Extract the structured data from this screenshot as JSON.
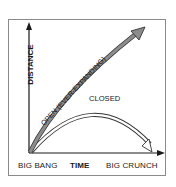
{
  "diagram": {
    "y_axis_label": "DISTANCE",
    "x_axis_label": "TIME",
    "x_start_label": "BIG BANG",
    "x_end_label": "BIG CRUNCH",
    "curves": [
      {
        "label": "OPEN (EVER-EXPANDING)",
        "style": "filled-gray-arrow",
        "color": "#8c8c8c"
      },
      {
        "label": "CLOSED",
        "style": "outline-arc-arrow",
        "color": "#ffffff"
      }
    ],
    "colors": {
      "frame": "#8a8a8a",
      "axis": "#1a1a1a",
      "open_fill": "#8c8c8c",
      "curve_outline": "#333333"
    }
  }
}
